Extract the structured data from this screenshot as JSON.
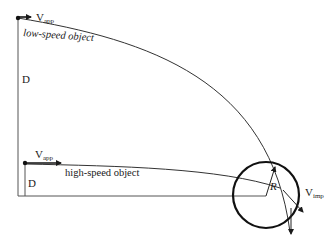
{
  "diagram": {
    "title": "",
    "labels": {
      "v_app_top": {
        "main": "V",
        "sub": "app"
      },
      "low_speed": "low-speed object",
      "d_top": "D",
      "v_app_mid": {
        "main": "V",
        "sub": "app"
      },
      "high_speed": "high-speed object",
      "d_bottom": "D",
      "radius": "R",
      "v_imp": {
        "main": "V",
        "sub": "imp"
      }
    },
    "colors": {
      "ink": "#1a1a1a",
      "background": "#ffffff"
    },
    "elements": [
      "low-speed trajectory",
      "high-speed trajectory",
      "target circle of radius R",
      "distance D markers",
      "approach velocity arrows",
      "impact velocity arrow"
    ]
  }
}
